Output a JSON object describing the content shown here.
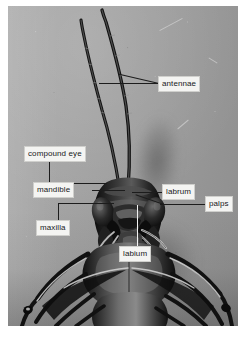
{
  "figure": {
    "kind": "labeled-photograph",
    "background_color": "#9e9e9e",
    "label_box_fill": "#f4f4f2",
    "label_text_color": "#17181a",
    "leader_line_color": "#1c1c1c",
    "white_leader_line_color": "#f2f2f2"
  },
  "labels": [
    {
      "id": "antennae",
      "text": "antennae",
      "x": 158,
      "y": 76
    },
    {
      "id": "compound-eye",
      "text": "compound eye",
      "x": 24,
      "y": 146
    },
    {
      "id": "mandible",
      "text": "mandible",
      "x": 33,
      "y": 182
    },
    {
      "id": "labrum",
      "text": "labrum",
      "x": 162,
      "y": 184
    },
    {
      "id": "palps",
      "text": "palps",
      "x": 205,
      "y": 196
    },
    {
      "id": "maxilla",
      "text": "maxilla",
      "x": 36,
      "y": 220
    },
    {
      "id": "labium",
      "text": "labium",
      "x": 119,
      "y": 246
    }
  ]
}
